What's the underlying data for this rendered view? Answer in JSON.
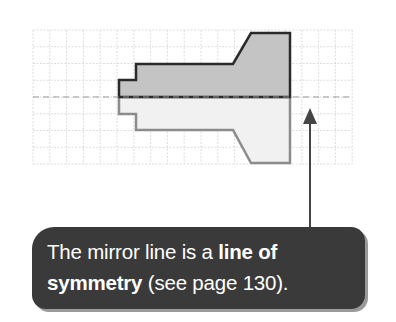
{
  "diagram": {
    "grid": {
      "x0": 33,
      "y0": 30,
      "cols": 19,
      "rows": 8,
      "cell_w": 16.8,
      "cell_h": 16.75,
      "color": "#d4d4d4"
    },
    "mirror_line": {
      "y": 97,
      "x1": 33,
      "x2": 353,
      "style": "dashed",
      "color": "#9a9a9a"
    },
    "original_shape": {
      "fill": "#c4c4c4",
      "stroke": "#2a2a2a",
      "points": "290,97 119,97 119,80 136,80 136,64 233,64 251,33 290,33"
    },
    "reflected_shape": {
      "fill": "#f1f1f1",
      "stroke": "#8c8c8c",
      "points": "290,97 119,97 119,114 136,114 136,130 233,130 251,163 290,163"
    },
    "arrow": {
      "x": 310,
      "y_tip": 108,
      "y_base": 227,
      "color": "#444444"
    }
  },
  "callout": {
    "line1_prefix": "The mirror line is a ",
    "line1_bold": "line of",
    "line2_bold": "symmetry",
    "line2_suffix": " (see page 130).",
    "background": "#3a3a3a"
  }
}
